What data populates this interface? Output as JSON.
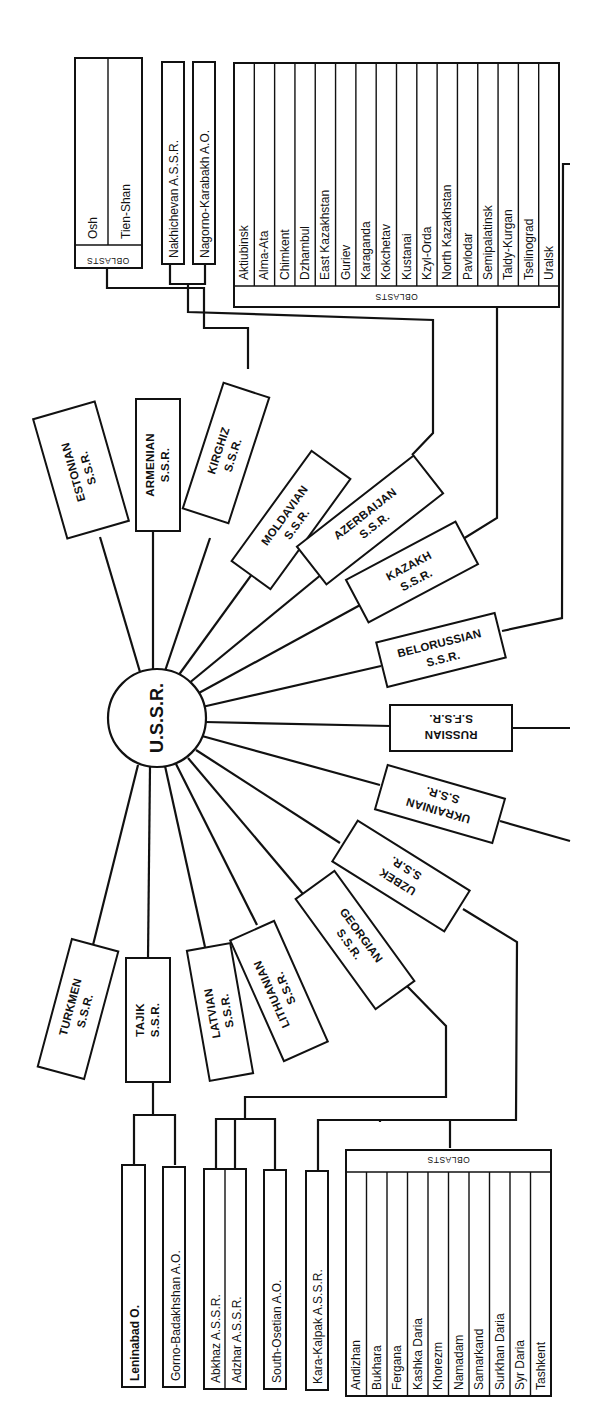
{
  "center": {
    "label": "U.S.S.R."
  },
  "header": {
    "text": ""
  },
  "republics": [
    {
      "id": "estonian",
      "line1": "ESTONIAN",
      "line2": "S.S.R."
    },
    {
      "id": "armenian",
      "line1": "ARMENIAN",
      "line2": "S.S.R."
    },
    {
      "id": "kirghiz",
      "line1": "KIRGHIZ",
      "line2": "S.S.R."
    },
    {
      "id": "moldavian",
      "line1": "MOLDAVIAN",
      "line2": "S.S.R."
    },
    {
      "id": "azerbaijan",
      "line1": "AZERBAIJAN",
      "line2": "S.S.R."
    },
    {
      "id": "kazakh",
      "line1": "KAZAKH",
      "line2": "S.S.R."
    },
    {
      "id": "belorussian",
      "line1": "BELORUSSIAN",
      "line2": "S.S.R."
    },
    {
      "id": "russian",
      "line1": "RUSSIAN",
      "line2": "S.F.S.R."
    },
    {
      "id": "ukrainian",
      "line1": "UKRAINIAN",
      "line2": "S.S.R."
    },
    {
      "id": "uzbek",
      "line1": "UZBEK",
      "line2": "S.S.R."
    },
    {
      "id": "georgian",
      "line1": "GEORGIAN",
      "line2": "S.S.R."
    },
    {
      "id": "lithuanian",
      "line1": "LITHUANIAN",
      "line2": "S.S.R."
    },
    {
      "id": "latvian",
      "line1": "LATVIAN",
      "line2": "S.S.R."
    },
    {
      "id": "tajik",
      "line1": "TAJIK",
      "line2": "S.S.R."
    },
    {
      "id": "turkmen",
      "line1": "TURKMEN",
      "line2": "S.S.R."
    }
  ],
  "kirghiz_oblasts": {
    "header": "OBLASTS",
    "items": [
      "Osh",
      "Tien-Shan"
    ]
  },
  "azerbaijan_units": [
    "Nakhichevan A.S.S.R.",
    "Nagorno-Karabakh A.O."
  ],
  "kazakh_oblasts": {
    "header": "OBLASTS",
    "items": [
      "Aktiubinsk",
      "Alma-Ata",
      "Chimkent",
      "Dzhambul",
      "East Kazakhstan",
      "Guriev",
      "Karaganda",
      "Kokchetav",
      "Kustanai",
      "Kzyl-Orda",
      "North Kazakhstan",
      "Pavlodar",
      "Semipalatinsk",
      "Taldy-Kurgan",
      "Tselinograd",
      "Uralsk"
    ]
  },
  "tajik_units": [
    "Leninabad O.",
    "Gorno-Badakhshan A.O."
  ],
  "georgian_units": [
    "Abkhaz A.S.S.R.",
    "Adzhar A.S.S.R.",
    "South-Osetian A.O."
  ],
  "uzbek_units": [
    "Kara-Kalpak A.S.S.R."
  ],
  "uzbek_oblasts": {
    "header": "OBLASTS",
    "items": [
      "Andizhan",
      "Bukhara",
      "Fergana",
      "Kashka Daria",
      "Khorezm",
      "Namadam",
      "Samarkand",
      "Surkhan Daria",
      "Syr Daria",
      "Tashkent"
    ]
  }
}
